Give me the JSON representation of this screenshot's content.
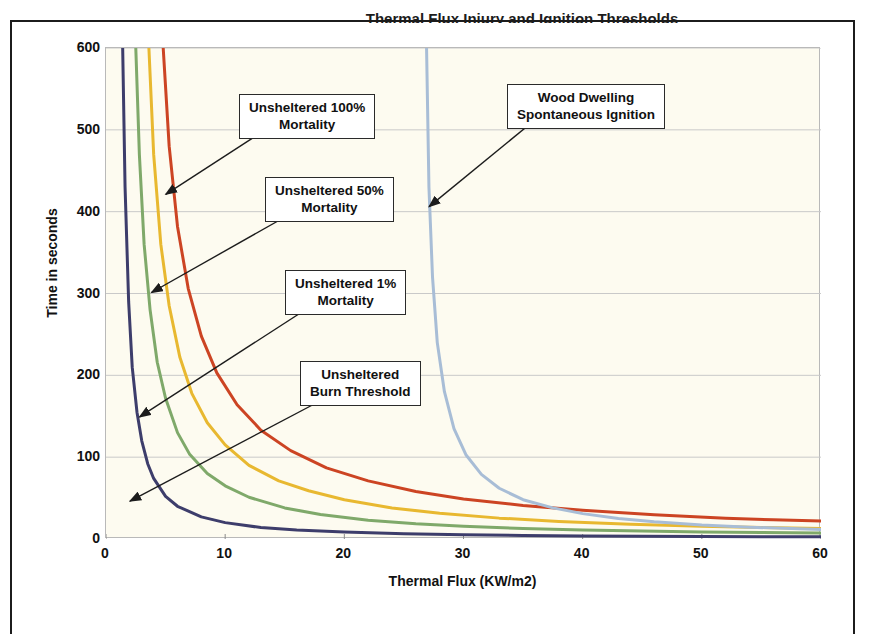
{
  "page": {
    "top_cut_text": "Thermal Flux Injury and Ignition Thresholds"
  },
  "chart_data": {
    "type": "line",
    "title": "",
    "xlabel": "Thermal Flux (KW/m2)",
    "ylabel": "Time in seconds",
    "xlim": [
      0,
      60
    ],
    "ylim": [
      0,
      600
    ],
    "xticks": [
      0,
      10,
      20,
      30,
      40,
      50,
      60
    ],
    "yticks": [
      0,
      100,
      200,
      300,
      400,
      500,
      600
    ],
    "grid": "horizontal",
    "legend_position": "none (inline callout labels)",
    "plot_background": "#fdfbf0",
    "series": [
      {
        "name": "Unsheltered Burn Threshold",
        "color": "#3d3d6b",
        "asymptote_x": 1.3,
        "x": [
          1.4,
          1.6,
          1.9,
          2.2,
          2.6,
          3.0,
          3.5,
          4.0,
          5.0,
          6.0,
          8.0,
          10.0,
          13.0,
          16.0,
          20.0,
          25.0,
          30.0,
          35.0,
          40.0,
          45.0,
          50.0,
          55.0,
          60.0
        ],
        "y": [
          600,
          430,
          290,
          210,
          155,
          120,
          92,
          74,
          52,
          40,
          27,
          20,
          14,
          11,
          8.5,
          6.5,
          5.2,
          4.4,
          3.8,
          3.4,
          3.0,
          2.8,
          2.6
        ]
      },
      {
        "name": "Unsheltered 1% Mortality",
        "color": "#7fa96a",
        "asymptote_x": 2.3,
        "x": [
          2.5,
          2.8,
          3.2,
          3.7,
          4.3,
          5.0,
          6.0,
          7.0,
          8.5,
          10.0,
          12.0,
          15.0,
          18.0,
          22.0,
          26.0,
          30.0,
          35.0,
          40.0,
          45.0,
          50.0,
          55.0,
          60.0
        ],
        "y": [
          600,
          470,
          360,
          280,
          216,
          172,
          130,
          104,
          80,
          65,
          51,
          38,
          30,
          23,
          18.5,
          15.5,
          12.8,
          11.0,
          9.7,
          8.7,
          8.0,
          7.4
        ]
      },
      {
        "name": "Unsheltered 50% Mortality",
        "color": "#e8b830",
        "asymptote_x": 3.4,
        "x": [
          3.6,
          4.0,
          4.6,
          5.3,
          6.2,
          7.2,
          8.5,
          10.0,
          12.0,
          14.5,
          17.0,
          20.0,
          24.0,
          28.0,
          33.0,
          38.0,
          44.0,
          50.0,
          55.0,
          60.0
        ],
        "y": [
          600,
          470,
          360,
          285,
          222,
          178,
          142,
          115,
          90,
          71,
          59,
          48,
          38,
          31.5,
          25.5,
          21.5,
          18.0,
          15.5,
          14.0,
          12.8
        ]
      },
      {
        "name": "Unsheltered 100% Mortality",
        "color": "#cc4423",
        "asymptote_x": 4.6,
        "x": [
          4.8,
          5.3,
          6.0,
          6.9,
          8.0,
          9.3,
          11.0,
          13.0,
          15.5,
          18.5,
          22.0,
          26.0,
          30.0,
          35.0,
          40.0,
          46.0,
          52.0,
          56.0,
          60.0
        ],
        "y": [
          600,
          480,
          382,
          306,
          248,
          203,
          164,
          133,
          108,
          87,
          71,
          58,
          49,
          41,
          35,
          29.5,
          25.5,
          23.5,
          22.0
        ]
      },
      {
        "name": "Wood Dwelling Spontaneous Ignition",
        "color": "#a8bdd6",
        "asymptote_x": 26.8,
        "x": [
          26.9,
          27.1,
          27.4,
          27.8,
          28.4,
          29.2,
          30.2,
          31.5,
          33.0,
          35.0,
          37.5,
          40.0,
          43.0,
          46.0,
          50.0,
          54.0,
          60.0
        ],
        "y": [
          600,
          430,
          320,
          240,
          180,
          135,
          103,
          79,
          62,
          48,
          38,
          31,
          25,
          21,
          17,
          14.5,
          11.5
        ]
      }
    ],
    "annotations": [
      {
        "label": "Unsheltered 100%\nMortality",
        "target_x": 5.1,
        "target_y": 420
      },
      {
        "label": "Unsheltered 50%\nMortality",
        "target_x": 3.9,
        "target_y": 300
      },
      {
        "label": "Unsheltered 1%\nMortality",
        "target_x": 2.9,
        "target_y": 148
      },
      {
        "label": "Unsheltered\nBurn Threshold",
        "target_x": 2.1,
        "target_y": 45
      },
      {
        "label": "Wood Dwelling\nSpontaneous Ignition",
        "target_x": 27.2,
        "target_y": 405
      }
    ]
  }
}
